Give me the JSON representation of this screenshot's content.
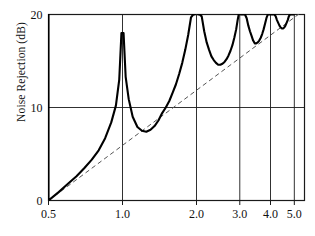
{
  "chart_data": {
    "type": "line",
    "title": "",
    "xlabel": "",
    "ylabel": "Noise Rejection (dB)",
    "xscale": "log",
    "yscale": "linear",
    "xlim": [
      0.5,
      5.5
    ],
    "ylim": [
      0,
      20
    ],
    "grid": true,
    "legend": "none",
    "xticks": [
      0.5,
      1.0,
      2.0,
      3.0,
      4.0,
      5.0
    ],
    "xticklabels": [
      "0.5",
      "1.0",
      "2.0",
      "3.0",
      "4.0",
      "5.0"
    ],
    "yticks": [
      0,
      10,
      20
    ],
    "yticklabels": [
      "0",
      "10",
      "20"
    ],
    "gridlines_vertical": [
      1.0,
      2.0,
      3.0,
      4.0,
      5.0
    ],
    "gridlines_horizontal": [
      10
    ],
    "series": [
      {
        "name": "comb-response",
        "style": "solid",
        "color": "#000000",
        "width": 2.1,
        "description": "Comb-filter noise rejection with poles at integer frequency ratios",
        "poles": [
          1.0,
          2.0,
          3.0,
          4.0,
          5.0
        ],
        "minima": [
          {
            "x": 1.5,
            "y": 10.0
          },
          {
            "x": 2.45,
            "y": 14.6
          },
          {
            "x": 3.45,
            "y": 16.8
          },
          {
            "x": 4.45,
            "y": 18.4
          }
        ],
        "start_point": {
          "x": 0.5,
          "y": 0.0
        },
        "x": [
          0.5,
          0.55,
          0.6,
          0.65,
          0.7,
          0.75,
          0.8,
          0.85,
          0.9,
          0.94,
          0.97,
          0.99,
          1.01,
          1.03,
          1.06,
          1.1,
          1.15,
          1.2,
          1.25,
          1.3,
          1.35,
          1.4,
          1.45,
          1.5,
          1.55,
          1.6,
          1.65,
          1.7,
          1.75,
          1.8,
          1.85,
          1.9,
          1.94,
          1.97,
          1.99,
          2.01,
          2.03,
          2.06,
          2.1,
          2.15,
          2.2,
          2.25,
          2.3,
          2.35,
          2.4,
          2.45,
          2.5,
          2.55,
          2.6,
          2.65,
          2.7,
          2.75,
          2.8,
          2.85,
          2.9,
          2.94,
          2.97,
          2.99,
          3.01,
          3.03,
          3.06,
          3.1,
          3.15,
          3.2,
          3.25,
          3.3,
          3.35,
          3.4,
          3.45,
          3.5,
          3.55,
          3.6,
          3.65,
          3.7,
          3.75,
          3.8,
          3.85,
          3.9,
          3.94,
          3.97,
          3.99,
          4.01,
          4.03,
          4.06,
          4.1,
          4.15,
          4.2,
          4.25,
          4.3,
          4.35,
          4.4,
          4.45,
          4.5,
          4.55,
          4.6,
          4.65,
          4.7,
          4.75,
          4.8,
          4.85,
          4.9,
          4.94,
          4.97,
          4.99
        ],
        "y": [
          0.0,
          0.9,
          1.8,
          2.6,
          3.5,
          4.4,
          5.4,
          6.7,
          8.4,
          10.2,
          13.0,
          18.0,
          18.0,
          13.3,
          10.9,
          9.0,
          7.9,
          7.5,
          7.4,
          7.6,
          8.0,
          8.6,
          9.4,
          10.0,
          10.7,
          11.6,
          12.5,
          13.6,
          14.8,
          16.2,
          17.8,
          19.7,
          20.0,
          20.0,
          20.0,
          20.0,
          20.0,
          20.0,
          19.8,
          18.2,
          17.0,
          16.2,
          15.5,
          15.1,
          14.8,
          14.6,
          14.6,
          14.7,
          14.9,
          15.2,
          15.6,
          16.1,
          16.7,
          17.5,
          18.4,
          19.4,
          20.0,
          20.0,
          20.0,
          20.0,
          20.0,
          20.0,
          20.0,
          19.6,
          18.8,
          18.2,
          17.7,
          17.2,
          16.9,
          16.9,
          17.0,
          17.2,
          17.5,
          17.9,
          18.4,
          19.0,
          19.6,
          20.0,
          20.0,
          20.0,
          20.0,
          20.0,
          20.0,
          20.0,
          20.0,
          20.0,
          19.8,
          19.4,
          19.1,
          18.8,
          18.6,
          18.5,
          18.5,
          18.6,
          18.8,
          19.1,
          19.4,
          19.8,
          20.0,
          20.0,
          20.0,
          20.0,
          20.0,
          20.0
        ]
      },
      {
        "name": "asymptote",
        "style": "dashed",
        "color": "#555555",
        "width": 1.0,
        "description": "Straight dashed reference line from (0.5, 0) rising linearly with log frequency",
        "x": [
          0.5,
          5.5
        ],
        "y": [
          0.0,
          20.6
        ]
      }
    ]
  },
  "axes": {
    "frame_color": "#1a1a1a",
    "grid_color": "#1a1a1a"
  }
}
